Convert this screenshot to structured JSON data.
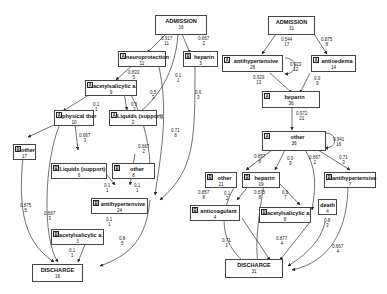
{
  "left_graph": {
    "nodes": {
      "admission": {
        "title": "ADMISSION",
        "count": "16"
      },
      "neuroprotection": {
        "tag": "A",
        "title": "neuroprotection",
        "count": "11"
      },
      "heparin": {
        "tag": "B",
        "title": "heparin",
        "count": "3"
      },
      "acetylsalicylic": {
        "tag": "A",
        "title": "acetylsalicylic a.",
        "count": "9"
      },
      "physical_ther": {
        "tag": "A",
        "title": "physical ther",
        "count": "10"
      },
      "liquids_support_1": {
        "tag": "A",
        "title": "Liquids (support)",
        "count": "2"
      },
      "other_a": {
        "tag": "B",
        "title": "other",
        "count": "17"
      },
      "liquids_support_2": {
        "tag": "B",
        "title": "Liquids (support)",
        "count": "6"
      },
      "other_b": {
        "tag": "B",
        "title": "other",
        "count": "8"
      },
      "antihypertensive": {
        "tag": "B",
        "title": "antihypertensive",
        "count": "24"
      },
      "acetylsalicylic_2": {
        "tag": "B",
        "title": "acetylsalicylic a.",
        "count": "3"
      },
      "discharge": {
        "title": "DISCHARGE",
        "count": "16"
      }
    },
    "edges": [
      {
        "p": "0.917",
        "n": "11"
      },
      {
        "p": "0.667",
        "n": "2"
      },
      {
        "p": "0.833",
        "n": "5"
      },
      {
        "p": "0.1",
        "n": "1"
      },
      {
        "p": "0.5",
        "n": "3"
      },
      {
        "p": "0.1",
        "n": "1"
      },
      {
        "p": "0.5",
        "n": "3"
      },
      {
        "p": "0.6",
        "n": "3"
      },
      {
        "p": "0.71",
        "n": "8"
      },
      {
        "p": "0.667",
        "n": "3"
      },
      {
        "p": "0.667",
        "n": "2"
      },
      {
        "p": "0.1",
        "n": "1"
      },
      {
        "p": "0.1",
        "n": "1"
      },
      {
        "p": "0.875",
        "n": "5"
      },
      {
        "p": "0.667",
        "n": "3"
      },
      {
        "p": "0.1",
        "n": "1"
      },
      {
        "p": "0.1",
        "n": "1"
      },
      {
        "p": "0.8",
        "n": "5"
      }
    ]
  },
  "right_graph": {
    "nodes": {
      "admission": {
        "title": "ADMISSION",
        "count": "31"
      },
      "antihypertensive": {
        "tag": "A",
        "title": "antihypertensive",
        "count": "28"
      },
      "antioedema": {
        "tag": "A",
        "title": "antioedema",
        "count": "14"
      },
      "heparin": {
        "tag": "A",
        "title": "heparin",
        "count": "36"
      },
      "other": {
        "tag": "A",
        "title": "other",
        "count": "36"
      },
      "other_b": {
        "tag": "B",
        "title": "other",
        "count": "21"
      },
      "heparin_b": {
        "tag": "B",
        "title": "heparin",
        "count": "19"
      },
      "antihypertensive_b": {
        "tag": "B",
        "title": "antihypertensive",
        "count": "7"
      },
      "anticoagulant": {
        "tag": "B",
        "title": "anticoagulant",
        "count": "4"
      },
      "acetylsalicylic": {
        "tag": "B",
        "title": "acetylsalicylic a.",
        "count": "8"
      },
      "death": {
        "title": "death",
        "count": "4"
      },
      "discharge": {
        "title": "DISCHARGE",
        "count": "31"
      }
    },
    "edges": [
      {
        "p": "0.544",
        "n": "17"
      },
      {
        "p": "0.875",
        "n": "8"
      },
      {
        "p": "0.923",
        "n": "12"
      },
      {
        "p": "0.929",
        "n": "13"
      },
      {
        "p": "0.9",
        "n": "9"
      },
      {
        "p": "0.972",
        "n": "21"
      },
      {
        "p": "0.941",
        "n": "16"
      },
      {
        "p": "0.857",
        "n": "8"
      },
      {
        "p": "0.9",
        "n": "9"
      },
      {
        "p": "0.667",
        "n": "2"
      },
      {
        "p": "0.71",
        "n": "3"
      },
      {
        "p": "0.857",
        "n": "8"
      },
      {
        "p": "0.1",
        "n": "2"
      },
      {
        "p": "0.875",
        "n": "8"
      },
      {
        "p": "0.8",
        "n": "7"
      },
      {
        "p": "0.71",
        "n": "1"
      },
      {
        "p": "0.877",
        "n": "4"
      },
      {
        "p": "0.8",
        "n": "3"
      },
      {
        "p": "0.667",
        "n": "4"
      }
    ]
  }
}
